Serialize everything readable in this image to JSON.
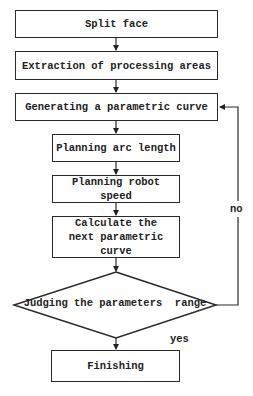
{
  "diagram": {
    "type": "flowchart",
    "nodes": [
      {
        "id": "split",
        "shape": "rect",
        "label": "Split face"
      },
      {
        "id": "extract",
        "shape": "rect",
        "label": "Extraction of processing areas"
      },
      {
        "id": "generate",
        "shape": "rect",
        "label": "Generating a parametric curve"
      },
      {
        "id": "arc",
        "shape": "rect",
        "label": "Planning arc length"
      },
      {
        "id": "speed",
        "shape": "rect",
        "label": "Planning robot speed"
      },
      {
        "id": "calc",
        "shape": "rect",
        "label": "Calculate the next parametric curve"
      },
      {
        "id": "judge",
        "shape": "diamond",
        "label": "Judging the parameters  range"
      },
      {
        "id": "finish",
        "shape": "rect",
        "label": "Finishing"
      }
    ],
    "edges": [
      {
        "from": "split",
        "to": "extract",
        "label": ""
      },
      {
        "from": "extract",
        "to": "generate",
        "label": ""
      },
      {
        "from": "generate",
        "to": "arc",
        "label": ""
      },
      {
        "from": "arc",
        "to": "speed",
        "label": ""
      },
      {
        "from": "speed",
        "to": "calc",
        "label": ""
      },
      {
        "from": "calc",
        "to": "judge",
        "label": ""
      },
      {
        "from": "judge",
        "to": "finish",
        "label": "yes"
      },
      {
        "from": "judge",
        "to": "generate",
        "label": "no"
      }
    ],
    "edge_labels": {
      "yes": "yes",
      "no": "no"
    }
  }
}
